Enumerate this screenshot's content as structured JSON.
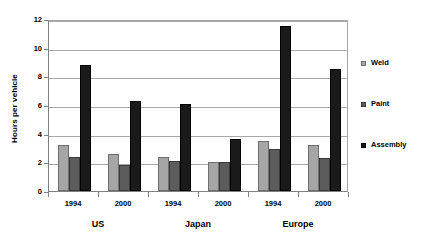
{
  "chart_data": {
    "type": "bar",
    "title": "",
    "xlabel": "",
    "ylabel": "Hours per vehicle",
    "ylim": [
      0,
      12
    ],
    "yticks": [
      0,
      2,
      4,
      6,
      8,
      10,
      12
    ],
    "grid": true,
    "legend_position": "right",
    "categories": [
      "1994",
      "2000",
      "1994",
      "2000",
      "1994",
      "2000"
    ],
    "groups": [
      {
        "name": "US",
        "members": [
          "1994",
          "2000"
        ]
      },
      {
        "name": "Japan",
        "members": [
          "1994",
          "2000"
        ]
      },
      {
        "name": "Europe",
        "members": [
          "1994",
          "2000"
        ]
      }
    ],
    "series": [
      {
        "name": "Weld",
        "color": "#a6a6a6",
        "values": [
          3.2,
          2.6,
          2.4,
          2.0,
          3.5,
          3.2
        ]
      },
      {
        "name": "Paint",
        "color": "#5c5c5c",
        "values": [
          2.4,
          1.8,
          2.1,
          2.0,
          2.9,
          2.3
        ]
      },
      {
        "name": "Assembly",
        "color": "#1a1a1a",
        "values": [
          8.8,
          6.25,
          6.1,
          3.6,
          11.5,
          8.5
        ]
      }
    ]
  },
  "legend": {
    "items": [
      {
        "label": "Weld"
      },
      {
        "label": "Paint"
      },
      {
        "label": "Assembly"
      }
    ]
  }
}
